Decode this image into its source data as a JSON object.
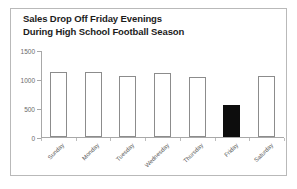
{
  "chart_data": {
    "type": "bar",
    "title": "Sales Drop Off Friday Evenings During High School Football Season",
    "title_lines": [
      "Sales Drop Off Friday Evenings",
      "During High School Football Season"
    ],
    "xlabel": "",
    "ylabel": "",
    "categories": [
      "Sunday",
      "Monday",
      "Tuesday",
      "Wednesday",
      "Thursday",
      "Friday",
      "Saturday"
    ],
    "values": [
      1120,
      1120,
      1050,
      1100,
      1030,
      550,
      1060
    ],
    "ylim": [
      0,
      1500
    ],
    "yticks": [
      0,
      500,
      1000,
      1500
    ],
    "ytick_labels": [
      "0",
      "500",
      "1000",
      "1500"
    ],
    "grid": false,
    "legend": false,
    "highlight_category": "Friday",
    "colors": {
      "bar_outline": "#8c8c8c",
      "bar_fill": "#ffffff",
      "highlight_fill": "#0d0d0d",
      "axis": "#a8a8a8",
      "tick_label": "#6a6a6a",
      "title": "#1c1c1c",
      "frame_border": "#b9b9b9"
    }
  }
}
